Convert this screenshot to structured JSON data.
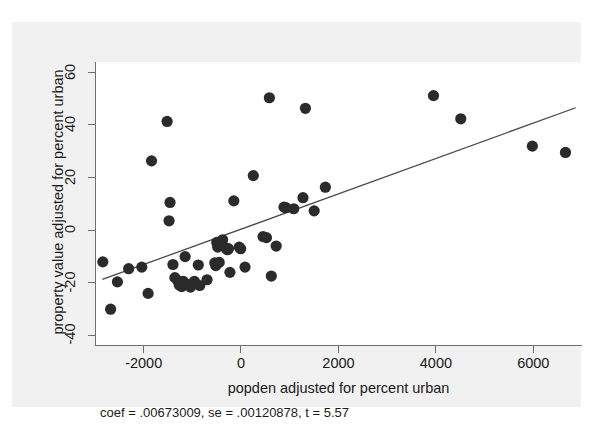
{
  "top_sliver": {
    "ghost_text": "—"
  },
  "colors": {
    "page_background": "#ffffff",
    "figure_background": "#f1f1f1",
    "panel_background": "#ffffff",
    "axis": "#6e6e6e",
    "marker": "#2b2b2b",
    "fit_line": "#4a4a4a",
    "text": "#1a1a1a"
  },
  "chart_data": {
    "type": "scatter",
    "title": "",
    "xlabel": "popden adjusted for percent urban",
    "ylabel": "property value adjusted for percent urban",
    "xlim": [
      -3000,
      7000
    ],
    "ylim": [
      -44,
      64
    ],
    "xticks": [
      -2000,
      0,
      2000,
      4000,
      6000
    ],
    "xtick_labels": [
      "-2000",
      "0",
      "2000",
      "4000",
      "6000"
    ],
    "yticks": [
      -40,
      -20,
      0,
      20,
      40,
      60
    ],
    "ytick_labels": [
      "-40",
      "-20",
      "0",
      "20",
      "40",
      "60"
    ],
    "grid": false,
    "legend": false,
    "annotation": "coef = .00673009, se = .00120878, t = 5.57",
    "fit_line": {
      "type": "linear",
      "coef": 0.00673009,
      "se": 0.00120878,
      "t": 5.57,
      "x_start": -2870,
      "y_start": -18.7,
      "x_end": 6850,
      "y_end": 46.6
    },
    "marker": {
      "shape": "circle",
      "radius_px": 5.6,
      "color": "#2b2b2b"
    },
    "points": [
      {
        "x": -2860,
        "y": -12.0
      },
      {
        "x": -2700,
        "y": -30.0
      },
      {
        "x": -2560,
        "y": -19.6
      },
      {
        "x": -2330,
        "y": -14.6
      },
      {
        "x": -2060,
        "y": -14.0
      },
      {
        "x": -1930,
        "y": -24.0
      },
      {
        "x": -1860,
        "y": 26.4
      },
      {
        "x": -1540,
        "y": 41.4
      },
      {
        "x": -1480,
        "y": 10.6
      },
      {
        "x": -1500,
        "y": 3.6
      },
      {
        "x": -1420,
        "y": -13.0
      },
      {
        "x": -1380,
        "y": -18.0
      },
      {
        "x": -1320,
        "y": -19.2
      },
      {
        "x": -1290,
        "y": -20.8
      },
      {
        "x": -1240,
        "y": -21.4
      },
      {
        "x": -1210,
        "y": -19.4
      },
      {
        "x": -1170,
        "y": -10.0
      },
      {
        "x": -1130,
        "y": -20.6
      },
      {
        "x": -1060,
        "y": -21.6
      },
      {
        "x": -980,
        "y": -19.4
      },
      {
        "x": -900,
        "y": -13.2
      },
      {
        "x": -870,
        "y": -21.0
      },
      {
        "x": -720,
        "y": -18.8
      },
      {
        "x": -560,
        "y": -12.4
      },
      {
        "x": -540,
        "y": -13.4
      },
      {
        "x": -520,
        "y": -4.6
      },
      {
        "x": -500,
        "y": -6.4
      },
      {
        "x": -470,
        "y": -12.2
      },
      {
        "x": -400,
        "y": -3.6
      },
      {
        "x": -330,
        "y": -6.8
      },
      {
        "x": -300,
        "y": -7.4
      },
      {
        "x": -280,
        "y": -7.0
      },
      {
        "x": -250,
        "y": -16.0
      },
      {
        "x": -170,
        "y": 11.2
      },
      {
        "x": -60,
        "y": -6.4
      },
      {
        "x": -30,
        "y": -7.0
      },
      {
        "x": 60,
        "y": -14.0
      },
      {
        "x": 230,
        "y": 20.8
      },
      {
        "x": 430,
        "y": -2.4
      },
      {
        "x": 500,
        "y": -2.8
      },
      {
        "x": 560,
        "y": 50.4
      },
      {
        "x": 600,
        "y": -17.4
      },
      {
        "x": 700,
        "y": -6.0
      },
      {
        "x": 860,
        "y": 8.8
      },
      {
        "x": 900,
        "y": 8.6
      },
      {
        "x": 1060,
        "y": 8.2
      },
      {
        "x": 1250,
        "y": 12.4
      },
      {
        "x": 1300,
        "y": 46.4
      },
      {
        "x": 1480,
        "y": 7.4
      },
      {
        "x": 1710,
        "y": 16.4
      },
      {
        "x": 3930,
        "y": 51.2
      },
      {
        "x": 4490,
        "y": 42.4
      },
      {
        "x": 5960,
        "y": 32.0
      },
      {
        "x": 6640,
        "y": 29.6
      }
    ]
  }
}
